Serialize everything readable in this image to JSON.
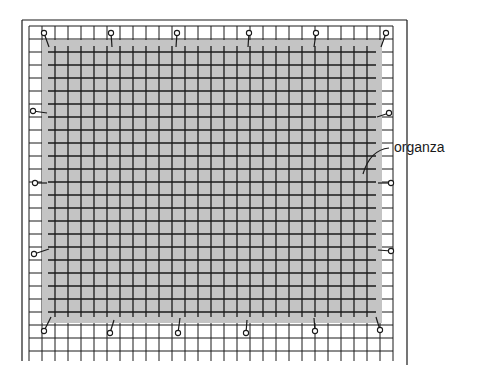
{
  "diagram": {
    "type": "pinned-fabric-on-grid",
    "colors": {
      "fabric": "#c4c4c4",
      "grid": "#1a1a1a",
      "background": "#ffffff"
    },
    "frame": {
      "x": 22,
      "y": 20,
      "right": 407
    },
    "grid": {
      "x0": 29,
      "y0": 26,
      "cell": 13,
      "cols": 28,
      "rows": 25
    },
    "fabric": {
      "x": 42,
      "y": 40,
      "width": 340,
      "height": 283
    },
    "labels": [
      {
        "text": "organza",
        "x": 394,
        "y": 148
      }
    ],
    "pins": [
      {
        "x": 44,
        "y": 33,
        "tx": 49,
        "ty": 47
      },
      {
        "x": 111,
        "y": 33,
        "tx": 112,
        "ty": 47
      },
      {
        "x": 177,
        "y": 33,
        "tx": 176,
        "ty": 47
      },
      {
        "x": 249,
        "y": 33,
        "tx": 248,
        "ty": 47
      },
      {
        "x": 316,
        "y": 33,
        "tx": 314,
        "ty": 47
      },
      {
        "x": 386,
        "y": 33,
        "tx": 381,
        "ty": 47
      },
      {
        "x": 33,
        "y": 111,
        "tx": 47,
        "ty": 113
      },
      {
        "x": 35,
        "y": 183,
        "tx": 47,
        "ty": 183
      },
      {
        "x": 34,
        "y": 254,
        "tx": 49,
        "ty": 249
      },
      {
        "x": 389,
        "y": 113,
        "tx": 377,
        "ty": 117
      },
      {
        "x": 391,
        "y": 183,
        "tx": 378,
        "ty": 183
      },
      {
        "x": 391,
        "y": 251,
        "tx": 378,
        "ty": 250
      },
      {
        "x": 44,
        "y": 331,
        "tx": 51,
        "ty": 317
      },
      {
        "x": 110,
        "y": 333,
        "tx": 114,
        "ty": 320
      },
      {
        "x": 178,
        "y": 333,
        "tx": 180,
        "ty": 318
      },
      {
        "x": 246,
        "y": 333,
        "tx": 247,
        "ty": 320
      },
      {
        "x": 315,
        "y": 331,
        "tx": 314,
        "ty": 318
      },
      {
        "x": 380,
        "y": 330,
        "tx": 376,
        "ty": 317
      }
    ]
  }
}
